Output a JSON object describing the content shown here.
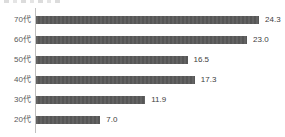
{
  "chart_data": {
    "type": "bar",
    "orientation": "horizontal",
    "title": "",
    "xlabel": "",
    "ylabel": "",
    "categories": [
      "70代",
      "60代",
      "50代",
      "40代",
      "30代",
      "20代"
    ],
    "values": [
      24.3,
      23.0,
      16.5,
      17.3,
      11.9,
      7.0
    ],
    "value_labels": [
      "24.3",
      "23.0",
      "16.5",
      "17.3",
      "11.9",
      "7.0"
    ],
    "xlim": [
      0,
      27
    ],
    "grid": false,
    "legend": null,
    "data_labels_position": "outside-end",
    "colors": {
      "bar": "#5b5b5b",
      "category_label": "#595959",
      "value_label": "#404040",
      "axis_line": "#bfbfbf",
      "background": "#ffffff"
    }
  }
}
